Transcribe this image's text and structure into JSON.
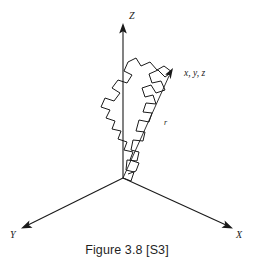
{
  "figure": {
    "caption": "Figure 3.8 [S3]",
    "background_color": "#ffffff",
    "ink_color": "#1a1a1a"
  },
  "axes": {
    "z_label": "Z",
    "x_label": "X",
    "y_label": "Y",
    "origin": {
      "x": 123,
      "y": 178
    },
    "z_tip": {
      "x": 123,
      "y": 24
    },
    "x_tip": {
      "x": 232,
      "y": 228
    },
    "y_tip": {
      "x": 22,
      "y": 228
    }
  },
  "vector": {
    "label": "r",
    "endpoint_label": "x, y, z",
    "start": {
      "x": 123,
      "y": 178
    },
    "end": {
      "x": 173,
      "y": 71
    }
  },
  "chain": {
    "description": "random-walk polymer chain",
    "points": "123,178 131,181 134,172 126,170 127,160 137,161 139,152 131,150 133,140 143,141 145,132 136,131 139,120 149,122 152,113 143,112 146,103 156,104 153,95 145,97 142,88 151,85 156,93 165,90 161,81 152,83 149,74 158,70 165,77 172,72 164,66 157,70 150,62 141,66 136,58 128,62 124,71 132,75 127,83 118,80 112,88 120,93 114,101 105,98 101,107 110,110 106,118 115,121 112,129 121,131 118,139 127,142 124,150 133,152 130,160 139,163 136,171 128,174"
  }
}
